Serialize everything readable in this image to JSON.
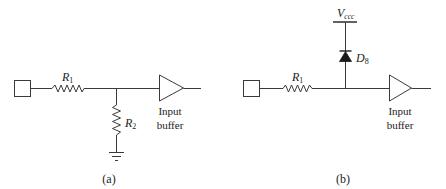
{
  "panel_a": {
    "caption": "(a)",
    "r1_label": "R",
    "r1_sub": "1",
    "r2_label": "R",
    "r2_sub": "2",
    "buffer_label_line1": "Input",
    "buffer_label_line2": "buffer"
  },
  "panel_b": {
    "caption": "(b)",
    "r1_label": "R",
    "r1_sub": "1",
    "vcc_label": "V",
    "vcc_sub": "ccc",
    "diode_label": "D",
    "diode_sub": "8",
    "buffer_label_line1": "Input",
    "buffer_label_line2": "buffer"
  },
  "colors": {
    "stroke": "#3a3a3a",
    "text": "#222222",
    "background": "#ffffff"
  }
}
